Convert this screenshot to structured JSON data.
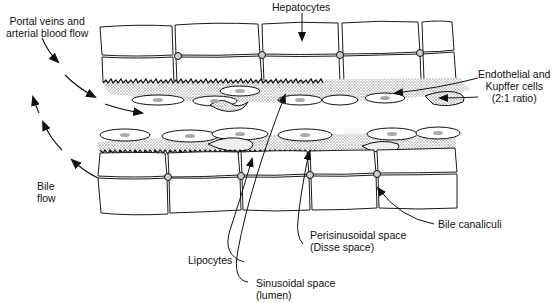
{
  "diagram": {
    "colors": {
      "line": "#1a1a1a",
      "stipple": "#9a9a9a",
      "background": "#ffffff"
    },
    "labels": {
      "hepatocytes": "Hepatocytes",
      "portal_line1": "Portal veins and",
      "portal_line2": "arterial blood flow",
      "endothelial_line1": "Endothelial and",
      "endothelial_line2": "Kupffer cells",
      "endothelial_line3": "(2:1 ratio)",
      "bile_flow_line1": "Bile",
      "bile_flow_line2": "flow",
      "lipocytes": "Lipocytes",
      "perisinusoidal_line1": "Perisinusoidal space",
      "perisinusoidal_line2": "(Disse space)",
      "sinusoidal_line1": "Sinusoidal space",
      "sinusoidal_line2": "(lumen)",
      "bile_canaliculi": "Bile canaliculi"
    }
  }
}
